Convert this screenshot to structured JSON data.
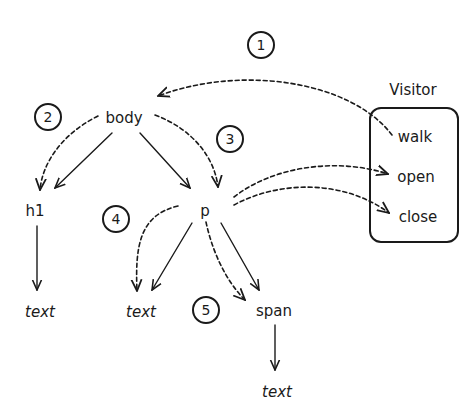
{
  "diagram": {
    "nodes": {
      "body": "body",
      "h1": "h1",
      "p": "p",
      "h1_text": "text",
      "p_text": "text",
      "span": "span",
      "span_text": "text"
    },
    "visitor": {
      "title": "Visitor",
      "methods": [
        "walk",
        "open",
        "close"
      ]
    },
    "steps": [
      "1",
      "2",
      "3",
      "4",
      "5"
    ],
    "colors": {
      "ink": "#1a1a1a",
      "background": "#ffffff"
    }
  }
}
